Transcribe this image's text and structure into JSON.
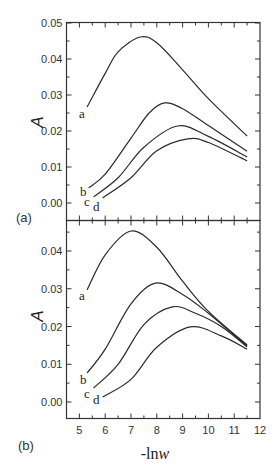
{
  "figure": {
    "x_axis_title_prefix": "-ln",
    "x_axis_title_var": "w",
    "y_axis_title": "A",
    "panel_a_label": "(a)",
    "panel_b_label": "(b)"
  },
  "chart_data": [
    {
      "type": "line",
      "panel": "(a)",
      "title": "",
      "xlabel": "-lnw",
      "ylabel": "A",
      "xlim": [
        4.5,
        12
      ],
      "ylim": [
        -0.005,
        0.05
      ],
      "xticks": [
        5,
        6,
        7,
        8,
        9,
        10,
        11,
        12
      ],
      "yticks": [
        "0.00",
        "0.01",
        "0.02",
        "0.03",
        "0.04",
        "0.05"
      ],
      "grid": false,
      "series": [
        {
          "name": "a",
          "x": [
            5.3,
            6.0,
            6.5,
            7.35,
            8.0,
            9.0,
            10.0,
            11.5
          ],
          "values": [
            0.0267,
            0.036,
            0.042,
            0.0461,
            0.0445,
            0.037,
            0.029,
            0.0186
          ]
        },
        {
          "name": "b",
          "x": [
            5.36,
            6.0,
            7.0,
            7.7,
            8.3,
            9.0,
            10.0,
            11.5
          ],
          "values": [
            0.0042,
            0.008,
            0.018,
            0.025,
            0.0278,
            0.0262,
            0.0215,
            0.0144
          ]
        },
        {
          "name": "c",
          "x": [
            5.55,
            6.5,
            7.5,
            8.8,
            10.0,
            11.5
          ],
          "values": [
            0.0017,
            0.007,
            0.0155,
            0.0214,
            0.0185,
            0.0128
          ]
        },
        {
          "name": "d",
          "x": [
            5.9,
            7.0,
            8.0,
            9.2,
            10.0,
            11.5
          ],
          "values": [
            0.0014,
            0.007,
            0.0145,
            0.0178,
            0.0168,
            0.0117
          ]
        }
      ]
    },
    {
      "type": "line",
      "panel": "(b)",
      "title": "",
      "xlabel": "-lnw",
      "ylabel": "A",
      "xlim": [
        4.5,
        12
      ],
      "ylim": [
        -0.004,
        0.046
      ],
      "xticks": [
        5,
        6,
        7,
        8,
        9,
        10,
        11,
        12
      ],
      "yticks": [
        "0.00",
        "0.01",
        "0.02",
        "0.03",
        "0.04"
      ],
      "grid": false,
      "series": [
        {
          "name": "a",
          "x": [
            5.3,
            6.0,
            7.0,
            8.0,
            9.0,
            10.0,
            11.5
          ],
          "values": [
            0.0297,
            0.039,
            0.0453,
            0.041,
            0.032,
            0.024,
            0.0151
          ]
        },
        {
          "name": "b",
          "x": [
            5.3,
            6.0,
            7.0,
            7.95,
            9.0,
            10.0,
            11.5
          ],
          "values": [
            0.0077,
            0.014,
            0.026,
            0.0315,
            0.0285,
            0.0235,
            0.0148
          ]
        },
        {
          "name": "c",
          "x": [
            5.55,
            6.5,
            7.5,
            8.6,
            9.5,
            10.5,
            11.5
          ],
          "values": [
            0.0037,
            0.01,
            0.0205,
            0.0252,
            0.0235,
            0.02,
            0.0146
          ]
        },
        {
          "name": "d",
          "x": [
            5.9,
            7.0,
            8.0,
            9.3,
            10.5,
            11.5
          ],
          "values": [
            0.0013,
            0.006,
            0.0145,
            0.0199,
            0.0175,
            0.014
          ]
        }
      ]
    }
  ]
}
